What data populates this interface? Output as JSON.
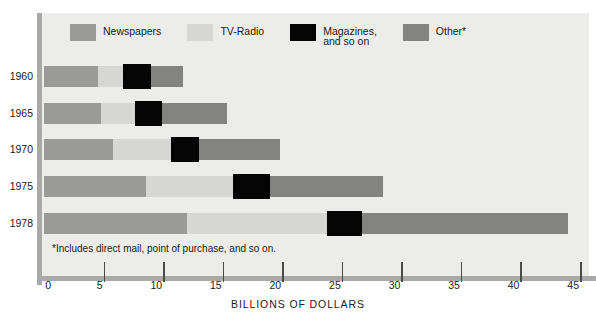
{
  "chart_data": {
    "type": "bar",
    "orientation": "horizontal",
    "stacked": true,
    "title": "",
    "xlabel": "BILLIONS OF DOLLARS",
    "ylabel": "",
    "xlim": [
      0,
      45
    ],
    "xticks": [
      0,
      5,
      10,
      15,
      20,
      25,
      30,
      35,
      40,
      45
    ],
    "grid": false,
    "legend_position": "top",
    "categories": [
      "1960",
      "1965",
      "1970",
      "1975",
      "1978"
    ],
    "series": [
      {
        "name": "Newspapers",
        "color": "#9a9a98",
        "values": [
          4.5,
          4.8,
          5.8,
          8.6,
          12.0
        ]
      },
      {
        "name": "TV-Radio",
        "color": "#d6d6d4",
        "values": [
          2.1,
          2.8,
          4.9,
          7.3,
          11.8
        ]
      },
      {
        "name": "Magazines, and so on",
        "color": "#050505",
        "values": [
          2.4,
          2.3,
          2.3,
          3.1,
          2.9
        ]
      },
      {
        "name": "Other*",
        "color": "#838381",
        "values": [
          2.7,
          5.5,
          6.8,
          9.5,
          17.3
        ]
      }
    ],
    "totals": [
      11.7,
      15.4,
      19.8,
      28.5,
      44.0
    ],
    "annotations": [
      "*Includes direct mail, point of purchase, and so on."
    ]
  },
  "legend": {
    "items": [
      {
        "label": "Newspapers",
        "swatch": "#9a9a98"
      },
      {
        "label": "TV-Radio",
        "swatch": "#d6d6d4"
      },
      {
        "label": "Magazines,\nand so on",
        "swatch": "#050505"
      },
      {
        "label": "Other*",
        "swatch": "#838381"
      }
    ]
  },
  "axis": {
    "title": "BILLIONS OF DOLLARS",
    "ticks": [
      "0",
      "5",
      "10",
      "15",
      "20",
      "25",
      "30",
      "35",
      "40",
      "45"
    ]
  },
  "years": [
    "1960",
    "1965",
    "1970",
    "1975",
    "1978"
  ],
  "footnote": "*Includes direct mail, point of purchase, and so on.",
  "colors": {
    "panel_background": "#ececeb",
    "rule": "#a9a9a7",
    "text": "#1b1b1b",
    "newspapers": "#9a9a98",
    "tv_radio": "#d6d6d4",
    "magazines": "#050505",
    "other": "#838381"
  }
}
